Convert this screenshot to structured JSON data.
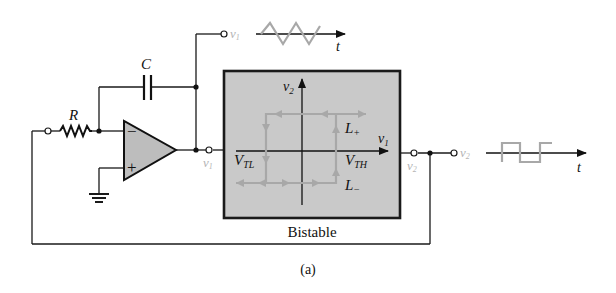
{
  "figure": {
    "caption": "(a)",
    "colors": {
      "wire": "#1a1a1a",
      "box_fill": "#c9c9c9",
      "box_border": "#1a1a1a",
      "opamp_fill": "#bdbdbd",
      "waveform": "#a8a8a8",
      "faint_label": "#b5b5b5"
    }
  },
  "components": {
    "resistor": {
      "label": "R"
    },
    "capacitor": {
      "label": "C"
    },
    "opamp": {
      "inverting": "−",
      "noninverting": "+"
    }
  },
  "nodes": {
    "v1_top": "v",
    "v1_top_sub": "1",
    "v1_out": "v",
    "v1_out_sub": "1",
    "v2_box": "v",
    "v2_box_sub": "2",
    "v2_out": "v",
    "v2_out_sub": "2"
  },
  "waveforms": {
    "triangle_axis": "t",
    "square_axis": "t"
  },
  "bistable": {
    "title": "Bistable",
    "y_axis": "v",
    "y_axis_sub": "2",
    "x_axis": "v",
    "x_axis_sub": "1",
    "L_plus": "L",
    "L_plus_sub": "+",
    "L_minus": "L",
    "L_minus_sub": "−",
    "VTL": "V",
    "VTL_sub": "TL",
    "VTH": "V",
    "VTH_sub": "TH"
  }
}
